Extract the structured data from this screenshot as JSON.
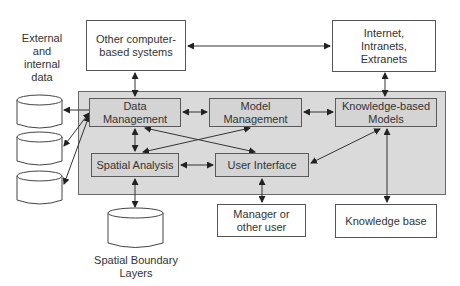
{
  "diagram": {
    "external_data_label": "External and internal data",
    "external_data_lines": [
      "External",
      "and",
      "internal",
      "data"
    ],
    "nodes": {
      "other_systems": {
        "line1": "Other computer-",
        "line2": "based systems"
      },
      "internet": {
        "line1": "Internet,",
        "line2": "Intranets,",
        "line3": "Extranets"
      },
      "data_management": {
        "line1": "Data",
        "line2": "Management"
      },
      "model_management": {
        "line1": "Model",
        "line2": "Management"
      },
      "knowledge_models": {
        "line1": "Knowledge-based",
        "line2": "Models"
      },
      "spatial_analysis": {
        "label": "Spatial Analysis"
      },
      "user_interface": {
        "label": "User Interface"
      },
      "manager": {
        "line1": "Manager or",
        "line2": "other user"
      },
      "knowledge_base": {
        "label": "Knowledge base"
      },
      "spatial_layers": {
        "line1": "Spatial Boundary",
        "line2": "Layers"
      }
    },
    "databases": [
      "external-db-1",
      "external-db-2",
      "external-db-3"
    ],
    "edges": [
      {
        "from": "Other computer-based systems",
        "to": "Internet, Intranets, Extranets",
        "type": "bidirectional"
      },
      {
        "from": "Other computer-based systems",
        "to": "Data Management",
        "type": "bidirectional"
      },
      {
        "from": "Internet, Intranets, Extranets",
        "to": "Knowledge-based Models",
        "type": "bidirectional"
      },
      {
        "from": "Data Management",
        "to": "Model Management",
        "type": "bidirectional"
      },
      {
        "from": "Model Management",
        "to": "Knowledge-based Models",
        "type": "bidirectional"
      },
      {
        "from": "Data Management",
        "to": "Spatial Analysis",
        "type": "bidirectional"
      },
      {
        "from": "Data Management",
        "to": "User Interface",
        "type": "bidirectional"
      },
      {
        "from": "Model Management",
        "to": "Spatial Analysis",
        "type": "bidirectional"
      },
      {
        "from": "Spatial Analysis",
        "to": "User Interface",
        "type": "bidirectional"
      },
      {
        "from": "Knowledge-based Models",
        "to": "User Interface",
        "type": "bidirectional"
      },
      {
        "from": "Knowledge-based Models",
        "to": "Knowledge base",
        "type": "bidirectional"
      },
      {
        "from": "User Interface",
        "to": "Manager or other user",
        "type": "bidirectional"
      },
      {
        "from": "Spatial Analysis",
        "to": "Spatial Boundary Layers",
        "type": "bidirectional"
      },
      {
        "from": "Data Management",
        "to": "External and internal data",
        "type": "bidirectional"
      }
    ],
    "colors": {
      "region_fill": "#dadada",
      "inner_box_fill": "#d4d4d4",
      "line": "#333333"
    }
  }
}
